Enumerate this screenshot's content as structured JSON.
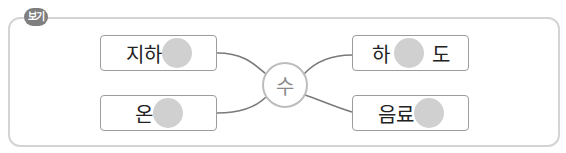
{
  "badge": {
    "label": "보기"
  },
  "center": {
    "syllable": "수"
  },
  "words": [
    {
      "before": "지하",
      "after": ""
    },
    {
      "before": "온",
      "after": ""
    },
    {
      "before": "하",
      "after": "도"
    },
    {
      "before": "음료",
      "after": ""
    }
  ],
  "colors": {
    "frame_border": "#d4d4d4",
    "badge_bg": "#7f7f7f",
    "box_border": "#9c9c9c",
    "blank_fill": "#d0d0d0",
    "line": "#7a7a7a"
  }
}
